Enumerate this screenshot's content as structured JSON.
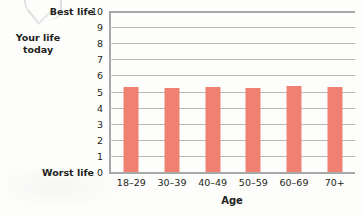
{
  "chart_data": {
    "type": "bar",
    "title": "",
    "categories": [
      "18–29",
      "30–39",
      "40–49",
      "50–59",
      "60–69",
      "70+"
    ],
    "values": [
      5.3,
      5.2,
      5.25,
      5.2,
      5.35,
      5.25
    ],
    "series": [
      {
        "name": "Your life today",
        "values": [
          5.3,
          5.2,
          5.25,
          5.2,
          5.35,
          5.25
        ]
      }
    ],
    "xlabel": "Age",
    "ylabel": "Your life today",
    "ylim": [
      0,
      10
    ],
    "ytick_step": 1,
    "yticks": [
      "10",
      "9",
      "8",
      "7",
      "6",
      "5",
      "4",
      "3",
      "2",
      "1",
      "0"
    ],
    "y_axis_endcaps": {
      "max": "Best life",
      "min": "Worst life"
    },
    "grid": true,
    "grid_axis": "y",
    "legend": "none",
    "bar_color": "#f08172",
    "grid_color": "#b9b9b9",
    "axis_color": "#a8a8a8",
    "text_color": "#231f20"
  }
}
